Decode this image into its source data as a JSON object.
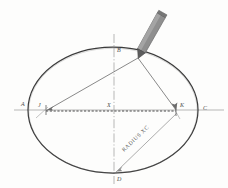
{
  "figure": {
    "background_color": "#fdfdfc",
    "ink_color": "#3b3b3b",
    "light_ink_color": "#8a8a8a",
    "pencil_color": "#8c8c8c",
    "labels": {
      "left_vertex": "A",
      "top_vertex": "B",
      "right_vertex": "C",
      "bottom_vertex": "D",
      "center": "X",
      "left_focus": "J",
      "right_focus": "K",
      "radius_note": "RADIUS XC"
    },
    "geometry": {
      "center": [
        113,
        110
      ],
      "semi_major_x": 85,
      "semi_minor_y": 63,
      "left_focus": [
        46,
        110
      ],
      "right_focus": [
        176,
        110
      ],
      "pencil_point": [
        138,
        58
      ],
      "bottom_point": [
        116,
        172
      ]
    }
  }
}
